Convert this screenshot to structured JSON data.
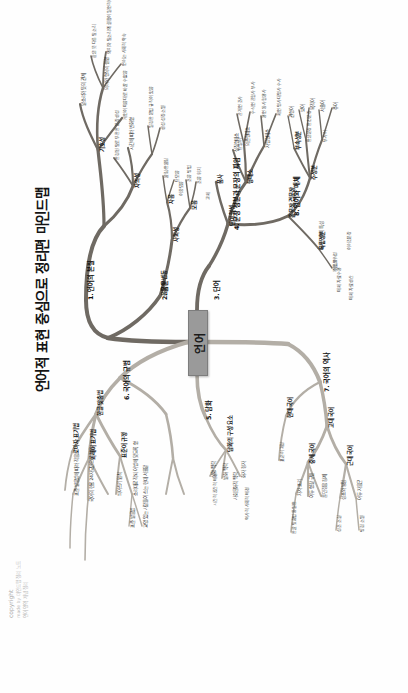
{
  "document": {
    "title": "언어적 표현 중심으로 정리편 마인드맵",
    "orientation": "rotated-90-ccw",
    "page_background": "#ffffff",
    "branch_color_dark": "#6f6a63",
    "branch_color_light": "#b3aea6",
    "center_node_color": "#9a9a9a",
    "text_color": "#101010"
  },
  "credit": {
    "line1": "copyright",
    "line2": "made by 마인드맵 정리 노트",
    "line3": "언어 영역 개념 정리"
  },
  "center": {
    "label": "언어"
  },
  "branches": [
    {
      "id": "b1",
      "number": "1.",
      "label": "1. 언어의 본질",
      "children": [
        {
          "label": "기호성",
          "leaves": [
            "의미와 형식의 결합",
            "말소리와 뜻의 관계"
          ]
        },
        {
          "label": "자의성",
          "leaves": [
            "의미와 말소리의 결합이 필연적이지 않음",
            "같은 뜻 다른 말소리"
          ]
        },
        {
          "label": "사회성",
          "leaves": [
            "언어는 사회적 약속",
            "개인이 마음대로 바꿀 수 없음"
          ]
        },
        {
          "label": "역사성",
          "leaves": [
            "시간에 따라 변화함",
            "생성·성장·소멸"
          ]
        },
        {
          "label": "규칙성",
          "leaves": [
            "일정한 문법 규칙이 있음"
          ]
        },
        {
          "label": "창조성",
          "leaves": [
            "한정된 말로 무한한 문장 생성"
          ]
        }
      ]
    },
    {
      "id": "b2",
      "number": "2.",
      "label": "2. 음운",
      "children": [
        {
          "label": "자음",
          "leaves": [
            "조음 위치",
            "조음 방법",
            "울림/안울림"
          ]
        },
        {
          "label": "모음",
          "leaves": [
            "단모음",
            "이중모음",
            "혀의 위치·입술 모양"
          ]
        },
        {
          "label": "음운의 변동",
          "leaves": [
            "교체",
            "탈락",
            "첨가",
            "축약"
          ]
        }
      ]
    },
    {
      "id": "b3",
      "number": "3.",
      "label": "3. 단어",
      "children": [
        {
          "label": "형태소",
          "leaves": [
            "자립형태소",
            "의존형태소",
            "실질형태소",
            "형식형태소"
          ]
        },
        {
          "label": "품사",
          "leaves": [
            "체언 명사 대명사 수사",
            "용언 동사 형용사",
            "수식언 관형사 부사",
            "관계언 조사",
            "독립언 감탄사"
          ]
        },
        {
          "label": "단어 형성",
          "leaves": [
            "단일어",
            "합성어",
            "파생어"
          ]
        }
      ]
    },
    {
      "id": "b4",
      "number": "4.",
      "label": "4. 문장 성분과 문장의 짜임",
      "children": [
        {
          "label": "주성분",
          "leaves": [
            "주어",
            "서술어",
            "목적어",
            "보어"
          ]
        },
        {
          "label": "부속성분",
          "leaves": [
            "관형어",
            "부사어"
          ]
        },
        {
          "label": "독립성분",
          "leaves": [
            "독립어"
          ]
        },
        {
          "label": "홑문장 겹문장",
          "leaves": [
            "안은문장 안긴문장",
            "이어진문장"
          ]
        }
      ]
    },
    {
      "id": "b5",
      "number": "5.",
      "label": "5. 담화",
      "children": [
        {
          "label": "담화의 구성 요소",
          "leaves": [
            "화자 청자",
            "발화 맥락"
          ]
        },
        {
          "label": "상황 맥락",
          "leaves": [
            "시간적 공간적 배경"
          ]
        },
        {
          "label": "사회문화적 맥락",
          "leaves": [
            "역사적 사회적 배경",
            "공동체의 가치관"
          ]
        }
      ]
    },
    {
      "id": "b6",
      "number": "6.",
      "label": "6. 국어의 규범",
      "children": [
        {
          "label": "한글 맞춤법",
          "leaves": [
            "소리대로 적되 어법에 맞도록 함",
            "띄어쓰기 원칙"
          ]
        },
        {
          "label": "표준어 규정",
          "leaves": [
            "교양 있는 사람들이 쓰는 현대 서울말",
            "표준 발음법"
          ]
        },
        {
          "label": "외래어 표기법",
          "leaves": [
            "국어의 현용 24자모만으로 적음"
          ]
        },
        {
          "label": "로마자 표기법",
          "leaves": [
            "표준 발음법에 따라 적음"
          ]
        }
      ]
    },
    {
      "id": "b7",
      "number": "7.",
      "label": "7. 국어의 역사",
      "children": [
        {
          "label": "고대 국어",
          "leaves": [
            "차자 표기",
            "이두 향찰 구결"
          ]
        },
        {
          "label": "중세 국어",
          "leaves": [
            "훈민정음 창제",
            "성조와 방점",
            "어두 자음군"
          ]
        },
        {
          "label": "근대 국어",
          "leaves": [
            "성조 소실",
            "방점 소멸",
            "모음조화 약화"
          ]
        },
        {
          "label": "현대 국어",
          "leaves": [
            "한글 맞춤법 통일안",
            "표준어 제정"
          ]
        }
      ]
    },
    {
      "id": "b8",
      "number": "8.",
      "label": "8. 언어와 매체",
      "children": [
        {
          "label": "매체 언어의 특성",
          "leaves": [
            "복합 양식성",
            "상호 작용성"
          ]
        },
        {
          "label": "매체 자료 수용",
          "leaves": [
            "신뢰성 판단",
            "타당성 판단"
          ]
        },
        {
          "label": "매체 자료 생산",
          "leaves": [
            "목적과 수용자 고려",
            "저작권 존중"
          ]
        }
      ]
    }
  ]
}
